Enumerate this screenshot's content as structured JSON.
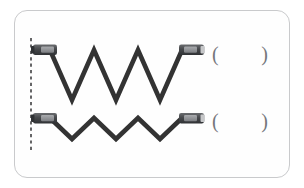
{
  "card": {
    "name": "waveform-comparison-card",
    "background_color": "#fefefe",
    "border_color": "#c9cacc"
  },
  "palette": {
    "wave_stroke": "#333333",
    "connector_body": "#4a4a4c",
    "connector_band": "#8d8f92",
    "connector_tip": "#c6c7c9",
    "dashed_guide": "#555557",
    "paren_color": "#75777b",
    "card_border": "#c9cacc"
  },
  "guide_line": {
    "label": "dashed-reference-line",
    "style": "dashed",
    "orientation": "vertical",
    "x": 31,
    "y_top": 38,
    "y_bottom": 151
  },
  "rows": [
    {
      "id": "row-1",
      "label": "upper-waveform-row",
      "wave": {
        "type": "triangular-zigzag",
        "amplitude_label": "large",
        "cycles": 3,
        "stroke_width": 4.6,
        "baseline_y": 74,
        "peak_y": 50,
        "trough_y": 100,
        "x_start": 50,
        "x_end": 182,
        "points": "50,50 72,100 94,50 116,100 138,50 160,100 182,50"
      },
      "left_connector": {
        "label": "left-probe-connector",
        "x": 33,
        "y": 44,
        "w": 23,
        "h": 11
      },
      "right_connector": {
        "label": "right-probe-connector",
        "x": 180,
        "y": 44,
        "w": 23,
        "h": 11
      },
      "answer": {
        "label": "answer-blank-row-1",
        "open_paren": "(",
        "close_paren": ")",
        "value": ""
      }
    },
    {
      "id": "row-2",
      "label": "lower-waveform-row",
      "wave": {
        "type": "triangular-zigzag",
        "amplitude_label": "small",
        "cycles": 3,
        "stroke_width": 4.6,
        "baseline_y": 128,
        "peak_y": 118,
        "trough_y": 139,
        "x_start": 50,
        "x_end": 182,
        "points": "50,118 72,139 94,118 116,139 138,118 160,139 182,118"
      },
      "left_connector": {
        "label": "left-probe-connector",
        "x": 33,
        "y": 113,
        "w": 23,
        "h": 11
      },
      "right_connector": {
        "label": "right-probe-connector",
        "x": 180,
        "y": 113,
        "w": 23,
        "h": 11
      },
      "answer": {
        "label": "answer-blank-row-2",
        "open_paren": "(",
        "close_paren": ")",
        "value": ""
      }
    }
  ]
}
